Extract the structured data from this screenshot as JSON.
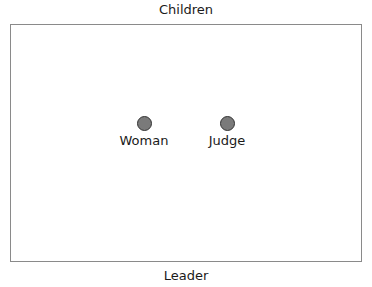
{
  "diagram": {
    "top_label": "Children",
    "bottom_label": "Leader",
    "nodes": [
      {
        "label": "Woman"
      },
      {
        "label": "Judge"
      }
    ],
    "colors": {
      "dot_fill": "#7a7a7a",
      "dot_stroke": "#333333",
      "frame": "#8a8a8a"
    }
  }
}
